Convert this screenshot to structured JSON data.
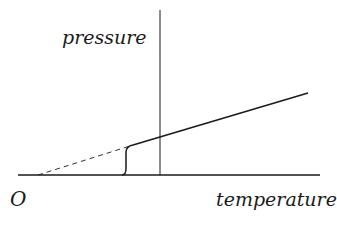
{
  "diagram": {
    "type": "line-diagram",
    "labels": {
      "y_axis": "pressure",
      "x_axis": "temperature",
      "origin": "O"
    },
    "colors": {
      "ink": "#1a1a1a",
      "background": "#ffffff"
    },
    "elements": {
      "horizontal_axis": {
        "x1": 18,
        "y1": 175,
        "x2": 320,
        "y2": 175
      },
      "vertical_line": {
        "x1": 160,
        "y1": 10,
        "x2": 160,
        "y2": 175
      },
      "extrapolated_dashed_line": {
        "x1": 38,
        "y1": 175,
        "x2": 130,
        "y2": 146
      },
      "transition_curve": {
        "from": [
          122,
          175
        ],
        "to": [
          132,
          146
        ]
      },
      "pressure_line": {
        "x1": 132,
        "y1": 146,
        "x2": 308,
        "y2": 93
      }
    }
  }
}
